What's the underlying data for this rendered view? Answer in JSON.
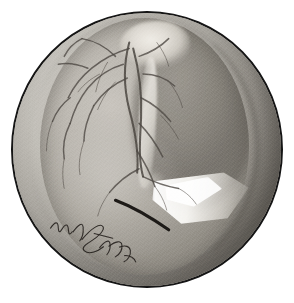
{
  "plate": {
    "title": "Otoscopic view of the right tympanic membrane",
    "medium": "Pencil and wash on paper",
    "background_color": "#ffffff",
    "field_outline_color": "#151515",
    "field_shape": "circle",
    "field_diameter_px": 272
  },
  "artwork": {
    "subject": "tympanic membrane (eardrum) seen through an aural speculum",
    "palette": {
      "paper": "#ffffff",
      "canal_light": "#cfccc6",
      "canal_mid": "#b0ada6",
      "canal_shadow": "#868279",
      "drum_light": "#c9c5be",
      "drum_mid": "#a8a49c",
      "drum_shadow": "#97938b",
      "vessel": "#4b4641",
      "incision": "#1d1a17",
      "light_reflex": "#ffffff",
      "outline": "#151515"
    }
  },
  "features": [
    {
      "id": "ear-canal-wall",
      "label": "External auditory canal wall",
      "note": "Outer ring of the field, lit from the upper left, shading to deep grey at the lower right."
    },
    {
      "id": "annulus",
      "label": "Tympanic annulus",
      "note": "Darker groove marking the oval rim of the drumhead."
    },
    {
      "id": "short-process",
      "label": "Short (lateral) process of the malleus",
      "note": "Pale bulbous prominence at the top of the drum."
    },
    {
      "id": "manubrium",
      "label": "Handle of the malleus (manubrium)",
      "note": "Pale vertical band running downward and slightly backward to the umbo."
    },
    {
      "id": "umbo",
      "label": "Umbo",
      "note": "Central depression at the lower end of the malleus handle."
    },
    {
      "id": "cone-of-light",
      "label": "Cone of light (light reflex)",
      "note": "Bright white triangular reflex in the antero-inferior quadrant."
    },
    {
      "id": "posterior-quadrant",
      "label": "Postero-superior quadrant",
      "note": "Darker domed half of the drum to the right of the malleus."
    },
    {
      "id": "vascular-strip",
      "label": "Vascular strip / radial vessels",
      "note": "Branching network of fine dark vessels over the upper and anterior drum."
    },
    {
      "id": "incision",
      "label": "Myringotomy incision",
      "note": "Dark curved arc drawn across the lower part of the drum."
    }
  ],
  "signature": {
    "present": true,
    "text": "v. Hasselt",
    "style": "cursive pencil script",
    "position": "lower left of the field"
  },
  "vessels": {
    "main": [
      "M 118 30 C 112 52 112 74 118 98 C 124 120 128 142 126 162",
      "M 122 36 C 128 58 131 82 130 106 C 129 128 127 148 132 166"
    ],
    "branches": [
      "M 118 36 C 104 40 92 46 80 56 C 70 64 62 74 56 86",
      "M 112 52 C 98 56 86 64 76 76 C 68 86 62 98 58 112",
      "M 116 66 C 102 72 90 82 82 94",
      "M 104 44 C 94 34 82 28 70 26",
      "M 128 44 C 140 40 150 34 158 26",
      "M 132 62 C 144 62 155 66 164 74",
      "M 130 86 C 142 92 152 100 160 110",
      "M 128 112 C 138 122 146 134 152 146",
      "M 126 140 C 134 152 140 164 144 176",
      "M 132 166 C 144 172 156 176 168 178",
      "M 128 158 C 116 164 106 172 98 182",
      "M 76 56 C 66 52 56 50 46 52",
      "M 58 86 C 50 92 44 100 40 110",
      "M 58 112 C 52 124 50 136 52 148",
      "M 82 94 C 76 106 72 118 72 130",
      "M 70 26 C 62 30 56 36 52 44"
    ],
    "fine": [
      "M 96 50 C 90 60 86 70 84 80",
      "M 88 62 C 80 66 72 72 66 80",
      "M 104 70 C 96 78 90 88 86 98",
      "M 146 30 C 152 38 156 46 158 54",
      "M 160 72 C 166 80 170 88 172 96",
      "M 150 104 C 158 112 164 120 168 128",
      "M 72 130 C 68 142 66 154 68 164",
      "M 52 148 C 50 158 50 168 52 178",
      "M 40 110 C 36 120 34 130 34 140",
      "M 144 176 C 150 184 154 192 156 200",
      "M 98 182 C 92 190 88 198 86 206",
      "M 168 178 C 176 182 182 188 186 194"
    ]
  },
  "incision_path": "M 104 190 C 120 196 138 206 158 220",
  "signature_strokes": [
    "M 2 26 C 5 18 8 16 10 22 C 12 28 13 30 15 24 C 17 17 20 16 22 22 C 24 28 25 29 27 24",
    "M 28 24 C 32 14 36 10 38 16 C 40 22 40 28 38 32",
    "M 40 30 C 48 14 56 6 60 10 C 63 13 58 22 50 30 C 44 36 42 40 46 42 C 52 45 60 40 66 32",
    "M 52 20 C 60 20 68 20 74 20",
    "M 62 34 C 66 26 70 22 72 26 C 74 30 74 36 72 40",
    "M 72 30 C 78 22 84 20 86 25 C 88 30 86 36 82 40",
    "M 84 28 C 90 24 95 24 97 29 C 99 34 97 40 93 43",
    "M 92 36 C 98 34 104 36 106 40"
  ]
}
